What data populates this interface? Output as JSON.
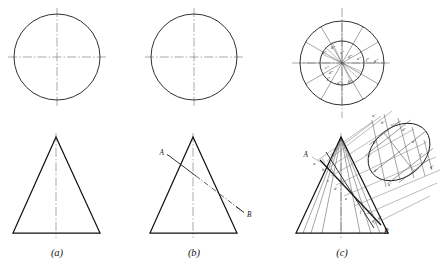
{
  "figure": {
    "background_color": "#ffffff",
    "line_color": "#1a1a1a",
    "construction_line_color": "#5c5c5c",
    "center_line_color": "#6f6f6f",
    "width": 445,
    "height": 268
  },
  "panels": [
    {
      "id": "a",
      "caption": "(a)",
      "description": "Top view circle and front view triangle of a right cone",
      "top_view": {
        "kind": "circle",
        "cx": 57,
        "cy": 57,
        "r": 43
      },
      "front_view": {
        "kind": "triangle",
        "apex_x": 56,
        "apex_y": 137,
        "base_left_x": 13,
        "base_right_x": 100,
        "base_y": 233
      },
      "center_lines": [
        "vertical",
        "horizontal"
      ]
    },
    {
      "id": "b",
      "caption": "(b)",
      "description": "Same cone with an oblique line A-B crossing the front view",
      "top_view": {
        "kind": "circle",
        "cx": 194,
        "cy": 57,
        "r": 43
      },
      "front_view": {
        "kind": "triangle",
        "apex_x": 193,
        "apex_y": 137,
        "base_left_x": 150,
        "base_right_x": 237,
        "base_y": 233
      },
      "line_ab": {
        "ax": 172,
        "ay": 158,
        "bx": 241,
        "by": 211,
        "style": "hidden-dash"
      },
      "labels": [
        {
          "name": "A",
          "text": "A",
          "x": 164,
          "y": 155
        },
        {
          "name": "B",
          "text": "B",
          "x": 246,
          "y": 216
        }
      ]
    },
    {
      "id": "c",
      "caption": "(c)",
      "description": "Construction: 12 element lines on cone, auxiliary circular view and inclined elliptical auxiliary view with points a through g",
      "top_view": {
        "kind": "concentric-circles",
        "cx": 342,
        "cy": 63,
        "outer_r": 42,
        "inner_r": 22,
        "divisions": 12
      },
      "front_view": {
        "kind": "triangle",
        "apex_x": 341,
        "apex_y": 137,
        "base_left_x": 296,
        "base_right_x": 388,
        "base_y": 233
      },
      "auxiliary_view": {
        "kind": "ellipse",
        "cx": 399,
        "cy": 152,
        "rx": 34,
        "ry": 25,
        "rotation_deg": -38
      },
      "line_ab": {
        "ax": 320,
        "ay": 161,
        "bx": 380,
        "by": 224
      },
      "labels": [
        {
          "name": "A",
          "text": "A",
          "x": 310,
          "y": 155
        },
        {
          "name": "B",
          "text": "B",
          "x": 382,
          "y": 231
        }
      ],
      "top_view_points": [
        "a\"",
        "b\"",
        "c\"",
        "d\"",
        "e\"",
        "f\"",
        "g\"",
        "j\""
      ],
      "aux_view_points": [
        "a'",
        "b'",
        "c'",
        "d'",
        "e'",
        "f'",
        "g'"
      ],
      "front_view_points": [
        "a",
        "b",
        "c",
        "d",
        "e",
        "f",
        "g"
      ]
    }
  ],
  "captions": {
    "a": "(a)",
    "b": "(b)",
    "c": "(c)"
  }
}
